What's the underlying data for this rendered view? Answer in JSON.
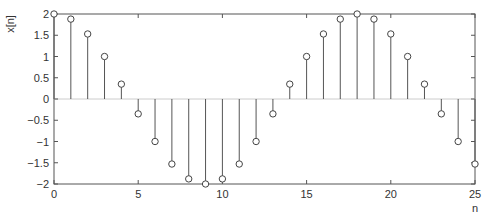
{
  "chart_data": {
    "type": "stem",
    "title": "",
    "xlabel": "n",
    "ylabel": "x[n]",
    "xlim": [
      0,
      25
    ],
    "ylim": [
      -2,
      2
    ],
    "grid": false,
    "legend": null,
    "x_ticks": [
      0,
      5,
      10,
      15,
      20,
      25
    ],
    "y_ticks": [
      -2,
      -1.5,
      -1,
      -0.5,
      0,
      0.5,
      1,
      1.5,
      2
    ],
    "x_tick_labels": [
      "0",
      "5",
      "10",
      "15",
      "20",
      "25"
    ],
    "y_tick_labels": [
      "-2",
      "-1.5",
      "-1",
      "-0.5",
      "0",
      "0.5",
      "1",
      "1.5",
      "2"
    ],
    "series": [
      {
        "name": "x[n]",
        "x": [
          0,
          1,
          2,
          3,
          4,
          5,
          6,
          7,
          8,
          9,
          10,
          11,
          12,
          13,
          14,
          15,
          16,
          17,
          18,
          19,
          20,
          21,
          22,
          23,
          24,
          25
        ],
        "values": [
          2.0,
          1.88,
          1.53,
          1.0,
          0.35,
          -0.35,
          -1.0,
          -1.53,
          -1.88,
          -2.0,
          -1.88,
          -1.53,
          -1.0,
          -0.35,
          0.35,
          1.0,
          1.53,
          1.88,
          2.0,
          1.88,
          1.53,
          1.0,
          0.35,
          -0.35,
          -1.0,
          -1.53
        ]
      }
    ]
  },
  "colors": {
    "axis": "#555555",
    "stem": "#555555",
    "marker": "#444444",
    "background": "#ffffff"
  }
}
